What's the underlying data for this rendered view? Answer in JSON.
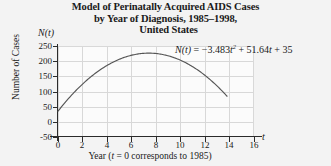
{
  "title": {
    "line1": "Model of Perinatally Acquired AIDS Cases",
    "line2": "by Year of Diagnosis, 1985–1998,",
    "line3": "United States"
  },
  "axes": {
    "y_name": "Number of Cases",
    "y_symbol": "N(t)",
    "x_symbol": "t",
    "x_caption_pre": "Year (",
    "x_caption_var": "t",
    "x_caption_post": " = 0 corresponds to 1985)"
  },
  "equation": {
    "lhs": "N(t)",
    "eq": "=",
    "a": "−3.483",
    "a_var": "t",
    "a_exp": "2",
    "b": "+ 51.64",
    "b_var": "t",
    "c": "+ 35",
    "full": "N(t) = −3.483t² + 51.64t + 35"
  },
  "colors": {
    "curve": "#555555",
    "grid": "#d8d8d8",
    "axis": "#2b2b2b",
    "background": "#f3f3f3",
    "plot_background": "#fbfbfb"
  },
  "chart_data": {
    "type": "line",
    "title": "Model of Perinatally Acquired AIDS Cases by Year of Diagnosis, 1985–1998, United States",
    "xlabel": "Year (t = 0 corresponds to 1985)",
    "ylabel": "Number of Cases",
    "xlim": [
      0,
      16
    ],
    "ylim": [
      -50,
      250
    ],
    "xticks": [
      0,
      2,
      4,
      6,
      8,
      10,
      12,
      14,
      16
    ],
    "yticks": [
      -50,
      0,
      50,
      100,
      150,
      200,
      250
    ],
    "grid": true,
    "legend": null,
    "annotations": [
      "N(t) = −3.483t² + 51.64t + 35"
    ],
    "function": {
      "expression": "-3.483*t^2 + 51.64*t + 35",
      "coefficients": {
        "a": -3.483,
        "b": 51.64,
        "c": 35
      },
      "domain": [
        0,
        13.8
      ],
      "vertex": {
        "t": 7.41,
        "N": 226.4
      }
    },
    "series": [
      {
        "name": "N(t)",
        "x": [
          0,
          1,
          2,
          3,
          4,
          5,
          6,
          7,
          8,
          9,
          10,
          11,
          12,
          13,
          13.8
        ],
        "values": [
          35,
          83.2,
          124.4,
          158.7,
          186.1,
          206.5,
          219.9,
          226.4,
          226,
          218.6,
          204.2,
          182.9,
          154.6,
          119.4,
          86.9
        ]
      }
    ]
  }
}
